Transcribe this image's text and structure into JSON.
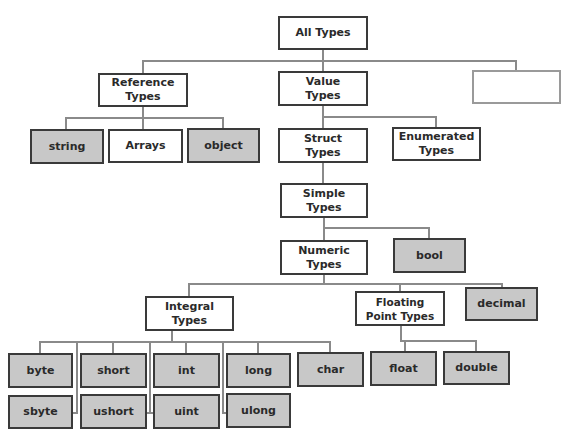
{
  "diagram": {
    "colors": {
      "leaf_fill": "#c8c8c8",
      "node_fill": "#ffffff",
      "border": "#3a3a3a",
      "connector": "#8a8a8a"
    },
    "nodes": {
      "all_types": "All Types",
      "reference_types": "Reference Types",
      "value_types": "Value Types",
      "empty_box": "",
      "string": "string",
      "arrays": "Arrays",
      "object": "object",
      "struct_types": "Struct Types",
      "enumerated_types": "Enumerated Types",
      "simple_types": "Simple Types",
      "numeric_types": "Numeric Types",
      "bool": "bool",
      "integral_types": "Integral Types",
      "floating_point_types": "Floating Point Types",
      "decimal": "decimal",
      "byte": "byte",
      "sbyte": "sbyte",
      "short": "short",
      "ushort": "ushort",
      "int": "int",
      "uint": "uint",
      "long": "long",
      "ulong": "ulong",
      "char": "char",
      "float": "float",
      "double": "double"
    },
    "edges": [
      [
        "All Types",
        "Reference Types"
      ],
      [
        "All Types",
        "Value Types"
      ],
      [
        "All Types",
        ""
      ],
      [
        "Reference Types",
        "string"
      ],
      [
        "Reference Types",
        "Arrays"
      ],
      [
        "Reference Types",
        "object"
      ],
      [
        "Value Types",
        "Struct Types"
      ],
      [
        "Value Types",
        "Enumerated Types"
      ],
      [
        "Struct Types",
        "Simple Types"
      ],
      [
        "Simple Types",
        "Numeric Types"
      ],
      [
        "Simple Types",
        "bool"
      ],
      [
        "Numeric Types",
        "Integral Types"
      ],
      [
        "Numeric Types",
        "Floating Point Types"
      ],
      [
        "Numeric Types",
        "decimal"
      ],
      [
        "Integral Types",
        "byte"
      ],
      [
        "Integral Types",
        "sbyte"
      ],
      [
        "Integral Types",
        "short"
      ],
      [
        "Integral Types",
        "ushort"
      ],
      [
        "Integral Types",
        "int"
      ],
      [
        "Integral Types",
        "uint"
      ],
      [
        "Integral Types",
        "long"
      ],
      [
        "Integral Types",
        "ulong"
      ],
      [
        "Integral Types",
        "char"
      ],
      [
        "Floating Point Types",
        "float"
      ],
      [
        "Floating Point Types",
        "double"
      ]
    ]
  }
}
